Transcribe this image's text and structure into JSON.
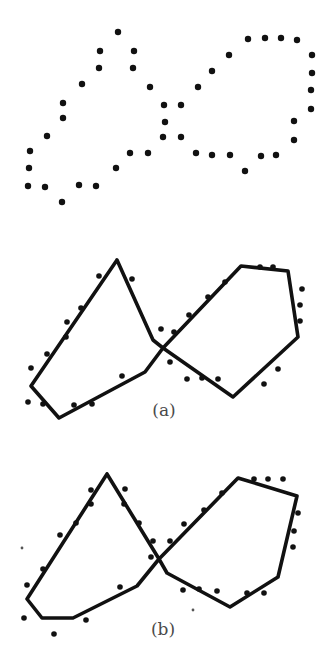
{
  "figure": {
    "width": 334,
    "height": 660,
    "dot_color": "#111111",
    "line_color": "#111111",
    "label_color": "#4a4a4a"
  },
  "panels": [
    {
      "id": "input",
      "label": "",
      "dots": [
        [
          118,
          32
        ],
        [
          100,
          51
        ],
        [
          134,
          51
        ],
        [
          99,
          68
        ],
        [
          133,
          68
        ],
        [
          82,
          84
        ],
        [
          150,
          87
        ],
        [
          63,
          103
        ],
        [
          63,
          118
        ],
        [
          164,
          105
        ],
        [
          181,
          105
        ],
        [
          165,
          122
        ],
        [
          47,
          136
        ],
        [
          163,
          137
        ],
        [
          181,
          137
        ],
        [
          30,
          151
        ],
        [
          130,
          153
        ],
        [
          148,
          153
        ],
        [
          29,
          168
        ],
        [
          116,
          168
        ],
        [
          28,
          186
        ],
        [
          45,
          187
        ],
        [
          79,
          185
        ],
        [
          96,
          186
        ],
        [
          62,
          202
        ],
        [
          198,
          87
        ],
        [
          212,
          71
        ],
        [
          229,
          55
        ],
        [
          248,
          39
        ],
        [
          265,
          38
        ],
        [
          281,
          38
        ],
        [
          297,
          40
        ],
        [
          312,
          55
        ],
        [
          312,
          73
        ],
        [
          311,
          90
        ],
        [
          311,
          109
        ],
        [
          294,
          121
        ],
        [
          294,
          140
        ],
        [
          276,
          155
        ],
        [
          261,
          156
        ],
        [
          245,
          171
        ],
        [
          230,
          155
        ],
        [
          212,
          155
        ],
        [
          196,
          153
        ]
      ],
      "small_dots": [],
      "polylines": []
    },
    {
      "id": "a",
      "label": "(a)",
      "label_pos": [
        164,
        402
      ],
      "dots": [
        [
          99,
          276
        ],
        [
          132,
          279
        ],
        [
          81,
          308
        ],
        [
          67,
          322
        ],
        [
          66,
          337
        ],
        [
          47,
          354
        ],
        [
          31,
          368
        ],
        [
          28,
          402
        ],
        [
          43,
          404
        ],
        [
          74,
          405
        ],
        [
          92,
          404
        ],
        [
          122,
          376
        ],
        [
          161,
          329
        ],
        [
          174,
          332
        ],
        [
          170,
          362
        ],
        [
          187,
          379
        ],
        [
          189,
          315
        ],
        [
          208,
          297
        ],
        [
          225,
          282
        ],
        [
          260,
          267
        ],
        [
          273,
          267
        ],
        [
          302,
          289
        ],
        [
          300,
          305
        ],
        [
          300,
          321
        ],
        [
          278,
          369
        ],
        [
          264,
          384
        ],
        [
          202,
          378
        ],
        [
          218,
          379
        ]
      ],
      "small_dots": [],
      "polylines": [
        [
          [
            117,
            260
          ],
          [
            31,
            386
          ],
          [
            59,
            418
          ],
          [
            145,
            372
          ],
          [
            163,
            348
          ],
          [
            241,
            266
          ],
          [
            288,
            271
          ],
          [
            298,
            337
          ],
          [
            233,
            397
          ],
          [
            163,
            348
          ],
          [
            153,
            340
          ],
          [
            117,
            260
          ]
        ]
      ]
    },
    {
      "id": "b",
      "label": "(b)",
      "label_pos": [
        163,
        621
      ],
      "dots": [
        [
          91,
          490
        ],
        [
          125,
          489
        ],
        [
          91,
          504
        ],
        [
          124,
          504
        ],
        [
          76,
          523
        ],
        [
          60,
          535
        ],
        [
          43,
          569
        ],
        [
          27,
          585
        ],
        [
          24,
          618
        ],
        [
          54,
          634
        ],
        [
          86,
          620
        ],
        [
          120,
          587
        ],
        [
          139,
          523
        ],
        [
          153,
          541
        ],
        [
          151,
          557
        ],
        [
          170,
          541
        ],
        [
          184,
          524
        ],
        [
          204,
          510
        ],
        [
          222,
          493
        ],
        [
          254,
          479
        ],
        [
          268,
          479
        ],
        [
          283,
          479
        ],
        [
          298,
          513
        ],
        [
          294,
          531
        ],
        [
          293,
          547
        ],
        [
          264,
          593
        ],
        [
          247,
          593
        ],
        [
          217,
          591
        ],
        [
          199,
          589
        ],
        [
          183,
          590
        ]
      ],
      "small_dots": [
        [
          22,
          548
        ],
        [
          193,
          610
        ]
      ],
      "polylines": [
        [
          [
            107,
            474
          ],
          [
            27,
            599
          ],
          [
            42,
            618
          ],
          [
            73,
            618
          ],
          [
            137,
            586
          ],
          [
            159,
            559
          ],
          [
            238,
            478
          ],
          [
            297,
            496
          ],
          [
            278,
            577
          ],
          [
            230,
            607
          ],
          [
            167,
            573
          ],
          [
            159,
            559
          ],
          [
            107,
            474
          ]
        ]
      ]
    }
  ]
}
